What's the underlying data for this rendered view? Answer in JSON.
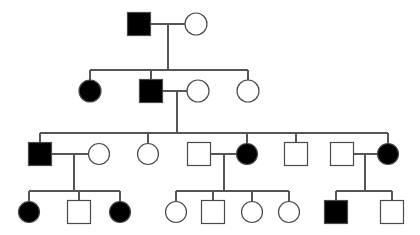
{
  "figure": {
    "kind": "pedigree-chart",
    "title": "",
    "background_color": "#ffffff",
    "line_color": "#555555",
    "symbol_stroke_color": "#4a4a4a",
    "affected_fill_color": "#000000",
    "unaffected_fill_color": "#ffffff",
    "generation_count": 4,
    "legend": {
      "square_meaning": "male",
      "circle_meaning": "female",
      "filled_meaning": "affected",
      "open_meaning": "unaffected"
    }
  },
  "chart_data": {
    "type": "diagram",
    "title": "",
    "xlabel": "",
    "ylabel": "",
    "generations": [
      {
        "generation": 1,
        "y": 24,
        "individuals": [
          {
            "id": "I-1",
            "shape": "square",
            "sex": "male",
            "status": "affected",
            "cx": 139,
            "cy": 24,
            "size": 23
          },
          {
            "id": "I-2",
            "shape": "circle",
            "sex": "female",
            "status": "unaffected",
            "cx": 196,
            "cy": 24,
            "size": 22
          }
        ]
      },
      {
        "generation": 2,
        "y": 91,
        "individuals": [
          {
            "id": "II-1",
            "shape": "circle",
            "sex": "female",
            "status": "affected",
            "cx": 90,
            "cy": 91,
            "size": 22
          },
          {
            "id": "II-2",
            "shape": "square",
            "sex": "male",
            "status": "affected",
            "cx": 151,
            "cy": 91,
            "size": 23
          },
          {
            "id": "II-3",
            "shape": "circle",
            "sex": "female",
            "status": "unaffected",
            "cx": 198,
            "cy": 91,
            "size": 22
          },
          {
            "id": "II-4",
            "shape": "circle",
            "sex": "female",
            "status": "unaffected",
            "cx": 248,
            "cy": 91,
            "size": 22
          }
        ]
      },
      {
        "generation": 3,
        "y": 154,
        "individuals": [
          {
            "id": "III-1",
            "shape": "square",
            "sex": "male",
            "status": "affected",
            "cx": 40,
            "cy": 154,
            "size": 23
          },
          {
            "id": "III-2",
            "shape": "circle",
            "sex": "female",
            "status": "unaffected",
            "cx": 99,
            "cy": 154,
            "size": 21
          },
          {
            "id": "III-3",
            "shape": "circle",
            "sex": "female",
            "status": "unaffected",
            "cx": 148,
            "cy": 154,
            "size": 21
          },
          {
            "id": "III-4",
            "shape": "square",
            "sex": "male",
            "status": "unaffected",
            "cx": 199,
            "cy": 154,
            "size": 23
          },
          {
            "id": "III-5",
            "shape": "circle",
            "sex": "female",
            "status": "affected",
            "cx": 247,
            "cy": 154,
            "size": 21
          },
          {
            "id": "III-6",
            "shape": "square",
            "sex": "male",
            "status": "unaffected",
            "cx": 296,
            "cy": 154,
            "size": 23
          },
          {
            "id": "III-7",
            "shape": "square",
            "sex": "male",
            "status": "unaffected",
            "cx": 342,
            "cy": 154,
            "size": 23
          },
          {
            "id": "III-8",
            "shape": "circle",
            "sex": "female",
            "status": "affected",
            "cx": 388,
            "cy": 154,
            "size": 21
          }
        ]
      },
      {
        "generation": 4,
        "y": 212,
        "individuals": [
          {
            "id": "IV-1",
            "shape": "circle",
            "sex": "female",
            "status": "affected",
            "cx": 29,
            "cy": 212,
            "size": 21
          },
          {
            "id": "IV-2",
            "shape": "square",
            "sex": "male",
            "status": "unaffected",
            "cx": 79,
            "cy": 212,
            "size": 23
          },
          {
            "id": "IV-3",
            "shape": "circle",
            "sex": "female",
            "status": "affected",
            "cx": 120,
            "cy": 212,
            "size": 21
          },
          {
            "id": "IV-4",
            "shape": "circle",
            "sex": "female",
            "status": "unaffected",
            "cx": 176,
            "cy": 212,
            "size": 21
          },
          {
            "id": "IV-5",
            "shape": "square",
            "sex": "male",
            "status": "unaffected",
            "cx": 213,
            "cy": 212,
            "size": 23
          },
          {
            "id": "IV-6",
            "shape": "circle",
            "sex": "female",
            "status": "unaffected",
            "cx": 252,
            "cy": 212,
            "size": 21
          },
          {
            "id": "IV-7",
            "shape": "circle",
            "sex": "female",
            "status": "unaffected",
            "cx": 289,
            "cy": 212,
            "size": 21
          },
          {
            "id": "IV-8",
            "shape": "square",
            "sex": "male",
            "status": "affected",
            "cx": 336,
            "cy": 212,
            "size": 23
          },
          {
            "id": "IV-9",
            "shape": "square",
            "sex": "male",
            "status": "unaffected",
            "cx": 392,
            "cy": 212,
            "size": 23
          }
        ]
      }
    ],
    "matings": [
      {
        "id": "M1",
        "partners": [
          "I-1",
          "I-2"
        ],
        "mating_line_y": 24,
        "x1": 151,
        "x2": 185,
        "descent_x": 168,
        "descent_to_y": 70
      },
      {
        "id": "M2",
        "partners": [
          "II-2",
          "II-3"
        ],
        "mating_line_y": 91,
        "x1": 163,
        "x2": 187,
        "descent_x": 177,
        "descent_to_y": 133
      },
      {
        "id": "M3",
        "partners": [
          "III-1",
          "III-2"
        ],
        "mating_line_y": 154,
        "x1": 52,
        "x2": 89,
        "descent_x": 74,
        "descent_to_y": 191
      },
      {
        "id": "M4",
        "partners": [
          "III-4",
          "III-5"
        ],
        "mating_line_y": 154,
        "x1": 211,
        "x2": 237,
        "descent_x": 224,
        "descent_to_y": 191
      },
      {
        "id": "M5",
        "partners": [
          "III-7",
          "III-8"
        ],
        "mating_line_y": 154,
        "x1": 354,
        "x2": 378,
        "descent_x": 365,
        "descent_to_y": 191
      }
    ],
    "sibships": [
      {
        "id": "S1",
        "parents": "M1",
        "bar_y": 70,
        "bar_x1": 90,
        "bar_x2": 248,
        "children": [
          "II-1",
          "II-2",
          "II-4"
        ],
        "child_drop_xs": [
          90,
          151,
          248
        ]
      },
      {
        "id": "S2",
        "parents": "M2",
        "bar_y": 133,
        "bar_x1": 40,
        "bar_x2": 388,
        "children": [
          "III-1",
          "III-3",
          "III-5",
          "III-6",
          "III-8"
        ],
        "child_drop_xs": [
          40,
          148,
          247,
          296,
          388
        ]
      },
      {
        "id": "S3",
        "parents": "M3",
        "bar_y": 191,
        "bar_x1": 29,
        "bar_x2": 120,
        "children": [
          "IV-1",
          "IV-2",
          "IV-3"
        ],
        "child_drop_xs": [
          29,
          79,
          120
        ]
      },
      {
        "id": "S4",
        "parents": "M4",
        "bar_y": 191,
        "bar_x1": 176,
        "bar_x2": 289,
        "children": [
          "IV-4",
          "IV-5",
          "IV-6",
          "IV-7"
        ],
        "child_drop_xs": [
          176,
          213,
          252,
          289
        ]
      },
      {
        "id": "S5",
        "parents": "M5",
        "bar_y": 191,
        "bar_x1": 336,
        "bar_x2": 392,
        "children": [
          "IV-8",
          "IV-9"
        ],
        "child_drop_xs": [
          336,
          392
        ]
      }
    ],
    "counts": {
      "total_individuals": 23,
      "affected_total": 9,
      "affected_males": 4,
      "affected_females": 5,
      "unaffected_total": 14
    }
  }
}
